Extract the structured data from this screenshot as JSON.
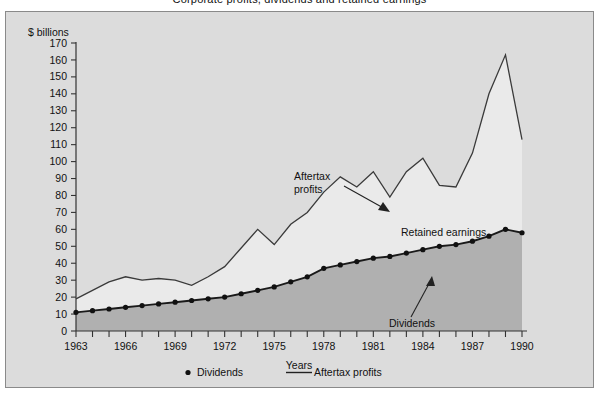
{
  "figure": {
    "cropped_title": "Corporate profits, dividends and retained earnings",
    "units_label": "$ billions",
    "xaxis_title": "Years",
    "background_color": "#dcdcdc",
    "fill_color": "#b0b0b0",
    "line_color": "#3a3a3a",
    "border_color": "#8a8a8a"
  },
  "legend": {
    "position": "bottom-center",
    "entries": [
      {
        "label": "Dividends",
        "marker": "dot"
      },
      {
        "label": "Aftertax profits",
        "marker": "line"
      }
    ]
  },
  "annotations": [
    {
      "name": "aftertax-profits-annotation",
      "text_line1": "Aftertax",
      "text_line2": "profits",
      "x": 288,
      "y": 168,
      "arrow": true
    },
    {
      "name": "retained-earnings-annotation",
      "text_line1": "Retained earnings",
      "text_line2": "",
      "x": 395,
      "y": 224,
      "arrow": false
    },
    {
      "name": "dividends-annotation",
      "text_line1": "Dividends",
      "text_line2": "",
      "x": 383,
      "y": 315,
      "arrow": true
    }
  ],
  "chart_data": {
    "type": "line",
    "title": "Corporate profits, dividends and retained earnings",
    "xlabel": "Years",
    "ylabel": "$ billions",
    "ylim": [
      0,
      170
    ],
    "ytick_step": 10,
    "yticks": [
      0,
      10,
      20,
      30,
      40,
      50,
      60,
      70,
      80,
      90,
      100,
      110,
      120,
      130,
      140,
      150,
      160,
      170
    ],
    "xlim": [
      1963,
      1990
    ],
    "xticks_labeled": [
      1963,
      1966,
      1969,
      1972,
      1975,
      1978,
      1981,
      1984,
      1987,
      1990
    ],
    "xtick_step_minor": 1,
    "grid": false,
    "x": [
      1963,
      1964,
      1965,
      1966,
      1967,
      1968,
      1969,
      1970,
      1971,
      1972,
      1973,
      1974,
      1975,
      1976,
      1977,
      1978,
      1979,
      1980,
      1981,
      1982,
      1983,
      1984,
      1985,
      1986,
      1987,
      1988,
      1989,
      1990
    ],
    "series": [
      {
        "name": "Aftertax profits",
        "marker": "none",
        "values": [
          19,
          24,
          29,
          32,
          30,
          31,
          30,
          27,
          32,
          38,
          49,
          60,
          51,
          63,
          70,
          82,
          91,
          85,
          94,
          79,
          94,
          102,
          86,
          85,
          105,
          140,
          163,
          113
        ]
      },
      {
        "name": "Dividends",
        "marker": "dot",
        "values": [
          11,
          12,
          13,
          14,
          15,
          16,
          17,
          18,
          19,
          20,
          22,
          24,
          26,
          29,
          32,
          37,
          39,
          41,
          43,
          44,
          46,
          48,
          50,
          51,
          53,
          56,
          60,
          58
        ]
      }
    ]
  }
}
